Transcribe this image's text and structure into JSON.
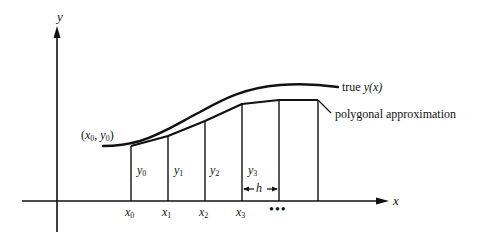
{
  "figure": {
    "type": "diagram"
  },
  "axes": {
    "x_label": "x",
    "y_label": "y"
  },
  "start_point": {
    "label_open": "(",
    "x": "x",
    "x_sub": "0",
    "sep": ", ",
    "y": "y",
    "y_sub": "0",
    "label_close": ")"
  },
  "ordinates": [
    {
      "name": "y",
      "sub": "0"
    },
    {
      "name": "y",
      "sub": "1"
    },
    {
      "name": "y",
      "sub": "2"
    },
    {
      "name": "y",
      "sub": "3"
    }
  ],
  "abscissae": [
    {
      "name": "x",
      "sub": "0"
    },
    {
      "name": "x",
      "sub": "1"
    },
    {
      "name": "x",
      "sub": "2"
    },
    {
      "name": "x",
      "sub": "3"
    }
  ],
  "continuation": "•••",
  "step": {
    "label": "h"
  },
  "curves": {
    "true_label_prefix": "true ",
    "true_label_fn": "y(x)",
    "polygon_label": "polygonal approximation"
  },
  "colors": {
    "ink": "#111111",
    "background": "#ffffff"
  }
}
